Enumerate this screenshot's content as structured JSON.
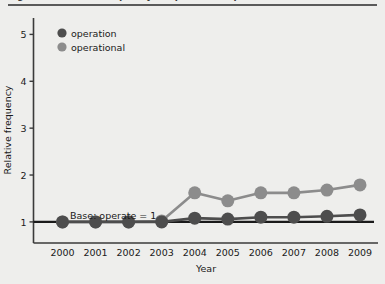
{
  "figure": {
    "caption_partial": "Figure 1.  Relative frequency of operation / operational",
    "background_color": "#eeeeec"
  },
  "legend": {
    "position": "top-left",
    "entries": [
      {
        "label": "operation",
        "color": "#4d4d4d",
        "marker": "circle"
      },
      {
        "label": "operational",
        "color": "#8c8c8c",
        "marker": "circle"
      }
    ]
  },
  "annotation": {
    "base_note": "Base: operate = 1"
  },
  "chart_data": {
    "type": "line",
    "title": "",
    "subtitle": "",
    "xlabel": "Year",
    "ylabel": "Relative frequency",
    "categories": [
      "2000",
      "2001",
      "2002",
      "2003",
      "2004",
      "2005",
      "2006",
      "2007",
      "2008",
      "2009"
    ],
    "x": [
      2000,
      2001,
      2002,
      2003,
      2004,
      2005,
      2006,
      2007,
      2008,
      2009
    ],
    "series": [
      {
        "name": "operation",
        "color": "#4d4d4d",
        "values": [
          1.0,
          1.0,
          1.0,
          1.0,
          1.08,
          1.06,
          1.1,
          1.1,
          1.12,
          1.15
        ]
      },
      {
        "name": "operational",
        "color": "#8c8c8c",
        "values": [
          1.0,
          1.0,
          1.0,
          1.02,
          1.62,
          1.45,
          1.62,
          1.62,
          1.68,
          1.79
        ]
      }
    ],
    "baseline": {
      "value": 1.0,
      "label": "Base: operate = 1",
      "color": "#1a1a1a"
    },
    "ylim": [
      0.55,
      5.35
    ],
    "yticks": [
      1,
      2,
      3,
      4,
      5
    ],
    "ytick_labels": [
      "1",
      "2",
      "3",
      "4",
      "5"
    ],
    "xtick_labels": [
      "2000",
      "2001",
      "2002",
      "2003",
      "2004",
      "2005",
      "2006",
      "2007",
      "2008",
      "2009"
    ],
    "grid": false,
    "legend_position": "upper left",
    "marker_size": 13,
    "line_width": 2.6
  }
}
